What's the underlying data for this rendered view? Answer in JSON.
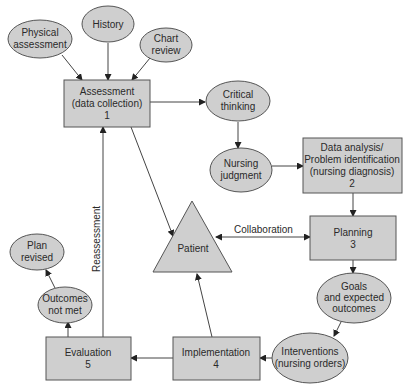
{
  "diagram": {
    "type": "nursing-process-flow",
    "colors": {
      "node_fill": "#cfcfcf",
      "node_stroke": "#555555",
      "edge": "#444444",
      "text": "#2a2a2a",
      "background": "#ffffff"
    },
    "nodes": {
      "physical_assessment": {
        "shape": "ellipse",
        "lines": [
          "Physical",
          "assessment"
        ]
      },
      "history": {
        "shape": "ellipse",
        "lines": [
          "History"
        ]
      },
      "chart_review": {
        "shape": "ellipse",
        "lines": [
          "Chart",
          "review"
        ]
      },
      "assessment": {
        "shape": "rect",
        "lines": [
          "Assessment",
          "(data collection)",
          "1"
        ]
      },
      "critical_thinking": {
        "shape": "ellipse",
        "lines": [
          "Critical",
          "thinking"
        ]
      },
      "nursing_judgment": {
        "shape": "ellipse",
        "lines": [
          "Nursing",
          "judgment"
        ]
      },
      "data_analysis": {
        "shape": "rect",
        "lines": [
          "Data analysis/",
          "Problem identification",
          "(nursing diagnosis)",
          "2"
        ]
      },
      "planning": {
        "shape": "rect",
        "lines": [
          "Planning",
          "3"
        ]
      },
      "goals": {
        "shape": "ellipse",
        "lines": [
          "Goals",
          "and expected",
          "outcomes"
        ]
      },
      "interventions": {
        "shape": "ellipse",
        "lines": [
          "Interventions",
          "(nursing orders)"
        ]
      },
      "implementation": {
        "shape": "rect",
        "lines": [
          "Implementation",
          "4"
        ]
      },
      "evaluation": {
        "shape": "rect",
        "lines": [
          "Evaluation",
          "5"
        ]
      },
      "outcomes_not_met": {
        "shape": "ellipse",
        "lines": [
          "Outcomes",
          "not met"
        ]
      },
      "plan_revised": {
        "shape": "ellipse",
        "lines": [
          "Plan",
          "revised"
        ]
      },
      "patient": {
        "shape": "triangle",
        "lines": [
          "Patient"
        ]
      }
    },
    "edge_labels": {
      "collaboration": "Collaboration",
      "reassessment": "Reassessment"
    },
    "edges": [
      {
        "from": "Physical assessment",
        "to": "Assessment"
      },
      {
        "from": "History",
        "to": "Assessment"
      },
      {
        "from": "Chart review",
        "to": "Assessment"
      },
      {
        "from": "Assessment",
        "to": "Critical thinking"
      },
      {
        "from": "Critical thinking",
        "to": "Nursing judgment"
      },
      {
        "from": "Nursing judgment",
        "to": "Data analysis"
      },
      {
        "from": "Data analysis",
        "to": "Planning"
      },
      {
        "from": "Planning",
        "to": "Goals and expected outcomes"
      },
      {
        "from": "Goals and expected outcomes",
        "to": "Interventions"
      },
      {
        "from": "Interventions",
        "to": "Implementation"
      },
      {
        "from": "Implementation",
        "to": "Evaluation"
      },
      {
        "from": "Evaluation",
        "to": "Outcomes not met"
      },
      {
        "from": "Outcomes not met",
        "to": "Plan revised"
      },
      {
        "from": "Evaluation",
        "to": "Assessment",
        "label": "Reassessment"
      },
      {
        "from": "Assessment",
        "to": "Patient"
      },
      {
        "from": "Implementation",
        "to": "Patient"
      },
      {
        "from": "Patient",
        "to": "Planning",
        "label": "Collaboration",
        "bidirectional": true
      }
    ]
  }
}
